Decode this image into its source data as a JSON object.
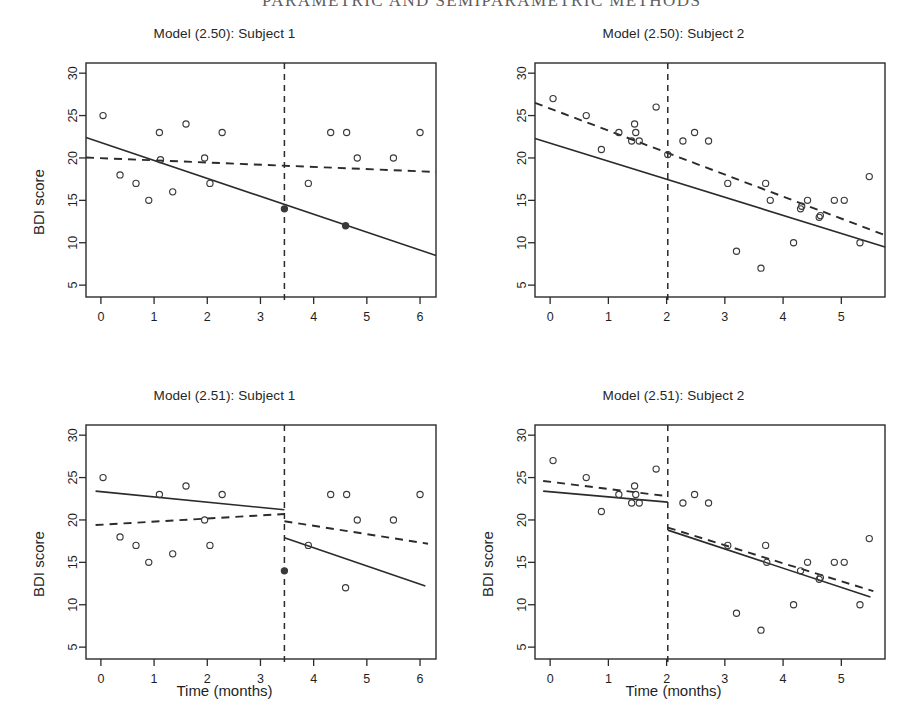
{
  "page": {
    "running_head": "PARAMETRIC AND SEMIPARAMETRIC METHODS",
    "folio": ""
  },
  "axis_titles": {
    "y": "BDI score",
    "x": "Time (months)"
  },
  "style": {
    "ink": "#1f1f1f",
    "line": "#2b2b2b",
    "point_stroke": "#3a3a3a",
    "background": "#ffffff"
  },
  "chart_data": [
    {
      "id": "panel-tl",
      "type": "scatter",
      "title": "Model (2.50): Subject 1",
      "xlabel": "",
      "ylabel": "BDI score",
      "xlim": [
        -0.28,
        6.3
      ],
      "ylim": [
        3.6,
        31.2
      ],
      "xticks": [
        0,
        1,
        2,
        3,
        4,
        5,
        6
      ],
      "yticks": [
        5,
        10,
        15,
        20,
        25,
        30
      ],
      "grid": false,
      "legend": "none",
      "points": [
        {
          "x": 0.04,
          "y": 25,
          "filled": false
        },
        {
          "x": 0.36,
          "y": 18,
          "filled": false
        },
        {
          "x": 0.66,
          "y": 17,
          "filled": false
        },
        {
          "x": 0.9,
          "y": 15,
          "filled": false
        },
        {
          "x": 1.1,
          "y": 23,
          "filled": false
        },
        {
          "x": 1.12,
          "y": 19.8,
          "filled": false
        },
        {
          "x": 1.35,
          "y": 16,
          "filled": false
        },
        {
          "x": 1.6,
          "y": 24,
          "filled": false
        },
        {
          "x": 1.95,
          "y": 20,
          "filled": false
        },
        {
          "x": 2.05,
          "y": 17,
          "filled": false
        },
        {
          "x": 2.28,
          "y": 23,
          "filled": false
        },
        {
          "x": 3.45,
          "y": 14,
          "filled": true
        },
        {
          "x": 3.9,
          "y": 17,
          "filled": false
        },
        {
          "x": 4.32,
          "y": 23,
          "filled": false
        },
        {
          "x": 4.6,
          "y": 12,
          "filled": true
        },
        {
          "x": 4.62,
          "y": 23,
          "filled": false
        },
        {
          "x": 4.82,
          "y": 20,
          "filled": false
        },
        {
          "x": 5.5,
          "y": 20,
          "filled": false
        },
        {
          "x": 6.0,
          "y": 23,
          "filled": false
        }
      ],
      "lines": [
        {
          "name": "subject-fit",
          "dash": "solid",
          "segments": [
            [
              {
                "x": -0.28,
                "y": 22.4
              },
              {
                "x": 6.3,
                "y": 8.5
              }
            ]
          ]
        },
        {
          "name": "population-fit",
          "dash": "dashed",
          "segments": [
            [
              {
                "x": -0.28,
                "y": 20.05
              },
              {
                "x": 6.3,
                "y": 18.35
              }
            ]
          ]
        }
      ],
      "vline": {
        "x": 3.45,
        "dash": "dashed"
      }
    },
    {
      "id": "panel-tr",
      "type": "scatter",
      "title": "Model (2.50): Subject 2",
      "xlabel": "",
      "ylabel": "BDI score",
      "xlim": [
        -0.26,
        5.75
      ],
      "ylim": [
        3.6,
        31.2
      ],
      "xticks": [
        0,
        1,
        2,
        3,
        4,
        5
      ],
      "yticks": [
        5,
        10,
        15,
        20,
        25,
        30
      ],
      "grid": false,
      "legend": "none",
      "points": [
        {
          "x": 0.05,
          "y": 27,
          "filled": false
        },
        {
          "x": 0.62,
          "y": 25,
          "filled": false
        },
        {
          "x": 0.88,
          "y": 21,
          "filled": false
        },
        {
          "x": 1.18,
          "y": 23,
          "filled": false
        },
        {
          "x": 1.4,
          "y": 22,
          "filled": false
        },
        {
          "x": 1.45,
          "y": 24,
          "filled": false
        },
        {
          "x": 1.47,
          "y": 23,
          "filled": false
        },
        {
          "x": 1.53,
          "y": 22,
          "filled": false
        },
        {
          "x": 1.82,
          "y": 26,
          "filled": false
        },
        {
          "x": 2.02,
          "y": 20.4,
          "filled": false
        },
        {
          "x": 2.28,
          "y": 22,
          "filled": false
        },
        {
          "x": 2.48,
          "y": 23,
          "filled": false
        },
        {
          "x": 2.72,
          "y": 22,
          "filled": false
        },
        {
          "x": 3.05,
          "y": 17,
          "filled": false
        },
        {
          "x": 3.2,
          "y": 9,
          "filled": false
        },
        {
          "x": 3.62,
          "y": 7,
          "filled": false
        },
        {
          "x": 3.7,
          "y": 17,
          "filled": false
        },
        {
          "x": 3.78,
          "y": 15,
          "filled": false
        },
        {
          "x": 4.18,
          "y": 10,
          "filled": false
        },
        {
          "x": 4.3,
          "y": 14,
          "filled": false
        },
        {
          "x": 4.32,
          "y": 14.3,
          "filled": false
        },
        {
          "x": 4.42,
          "y": 15,
          "filled": false
        },
        {
          "x": 4.62,
          "y": 13,
          "filled": false
        },
        {
          "x": 4.64,
          "y": 13.2,
          "filled": false
        },
        {
          "x": 4.88,
          "y": 15,
          "filled": false
        },
        {
          "x": 5.05,
          "y": 15,
          "filled": false
        },
        {
          "x": 5.32,
          "y": 10,
          "filled": false
        },
        {
          "x": 5.48,
          "y": 17.8,
          "filled": false
        }
      ],
      "lines": [
        {
          "name": "subject-fit",
          "dash": "solid",
          "segments": [
            [
              {
                "x": -0.26,
                "y": 22.3
              },
              {
                "x": 5.75,
                "y": 9.5
              }
            ]
          ]
        },
        {
          "name": "population-fit",
          "dash": "dashed",
          "segments": [
            [
              {
                "x": -0.26,
                "y": 26.5
              },
              {
                "x": 5.75,
                "y": 10.9
              }
            ]
          ]
        }
      ],
      "vline": {
        "x": 2.02,
        "dash": "dashed"
      }
    },
    {
      "id": "panel-bl",
      "type": "scatter",
      "title": "Model (2.51): Subject 1",
      "xlabel": "Time (months)",
      "ylabel": "BDI score",
      "xlim": [
        -0.28,
        6.3
      ],
      "ylim": [
        3.6,
        31.2
      ],
      "xticks": [
        0,
        1,
        2,
        3,
        4,
        5,
        6
      ],
      "yticks": [
        5,
        10,
        15,
        20,
        25,
        30
      ],
      "grid": false,
      "legend": "none",
      "points": [
        {
          "x": 0.04,
          "y": 25,
          "filled": false
        },
        {
          "x": 0.36,
          "y": 18,
          "filled": false
        },
        {
          "x": 0.66,
          "y": 17,
          "filled": false
        },
        {
          "x": 0.9,
          "y": 15,
          "filled": false
        },
        {
          "x": 1.1,
          "y": 23,
          "filled": false
        },
        {
          "x": 1.35,
          "y": 16,
          "filled": false
        },
        {
          "x": 1.6,
          "y": 24,
          "filled": false
        },
        {
          "x": 1.95,
          "y": 20,
          "filled": false
        },
        {
          "x": 2.05,
          "y": 17,
          "filled": false
        },
        {
          "x": 2.28,
          "y": 23,
          "filled": false
        },
        {
          "x": 3.45,
          "y": 14,
          "filled": true
        },
        {
          "x": 3.9,
          "y": 17,
          "filled": false
        },
        {
          "x": 4.32,
          "y": 23,
          "filled": false
        },
        {
          "x": 4.6,
          "y": 12,
          "filled": false
        },
        {
          "x": 4.62,
          "y": 23,
          "filled": false
        },
        {
          "x": 4.82,
          "y": 20,
          "filled": false
        },
        {
          "x": 5.5,
          "y": 20,
          "filled": false
        },
        {
          "x": 6.0,
          "y": 23,
          "filled": false
        }
      ],
      "lines": [
        {
          "name": "subject-fit",
          "dash": "solid",
          "segments": [
            [
              {
                "x": -0.1,
                "y": 23.4
              },
              {
                "x": 3.45,
                "y": 21.2
              }
            ],
            [
              {
                "x": 3.45,
                "y": 17.9
              },
              {
                "x": 6.1,
                "y": 12.2
              }
            ]
          ]
        },
        {
          "name": "population-fit",
          "dash": "dashed",
          "segments": [
            [
              {
                "x": -0.1,
                "y": 19.4
              },
              {
                "x": 3.45,
                "y": 20.7
              }
            ],
            [
              {
                "x": 3.45,
                "y": 19.85
              },
              {
                "x": 6.15,
                "y": 17.2
              }
            ]
          ]
        }
      ],
      "vline": {
        "x": 3.45,
        "dash": "dashed"
      }
    },
    {
      "id": "panel-br",
      "type": "scatter",
      "title": "Model (2.51): Subject 2",
      "xlabel": "Time (months)",
      "ylabel": "BDI score",
      "xlim": [
        -0.26,
        5.75
      ],
      "ylim": [
        3.6,
        31.2
      ],
      "xticks": [
        0,
        1,
        2,
        3,
        4,
        5
      ],
      "yticks": [
        5,
        10,
        15,
        20,
        25,
        30
      ],
      "grid": false,
      "legend": "none",
      "points": [
        {
          "x": 0.05,
          "y": 27,
          "filled": false
        },
        {
          "x": 0.62,
          "y": 25,
          "filled": false
        },
        {
          "x": 0.88,
          "y": 21,
          "filled": false
        },
        {
          "x": 1.18,
          "y": 23,
          "filled": false
        },
        {
          "x": 1.4,
          "y": 22,
          "filled": false
        },
        {
          "x": 1.45,
          "y": 24,
          "filled": false
        },
        {
          "x": 1.47,
          "y": 23,
          "filled": false
        },
        {
          "x": 1.53,
          "y": 22,
          "filled": false
        },
        {
          "x": 1.82,
          "y": 26,
          "filled": false
        },
        {
          "x": 2.28,
          "y": 22,
          "filled": false
        },
        {
          "x": 2.48,
          "y": 23,
          "filled": false
        },
        {
          "x": 2.72,
          "y": 22,
          "filled": false
        },
        {
          "x": 3.05,
          "y": 17,
          "filled": false
        },
        {
          "x": 3.2,
          "y": 9,
          "filled": false
        },
        {
          "x": 3.62,
          "y": 7,
          "filled": false
        },
        {
          "x": 3.7,
          "y": 17,
          "filled": false
        },
        {
          "x": 3.72,
          "y": 15,
          "filled": false
        },
        {
          "x": 4.18,
          "y": 10,
          "filled": false
        },
        {
          "x": 4.3,
          "y": 14,
          "filled": false
        },
        {
          "x": 4.42,
          "y": 15,
          "filled": false
        },
        {
          "x": 4.62,
          "y": 13,
          "filled": false
        },
        {
          "x": 4.64,
          "y": 13.2,
          "filled": false
        },
        {
          "x": 4.88,
          "y": 15,
          "filled": false
        },
        {
          "x": 5.05,
          "y": 15,
          "filled": false
        },
        {
          "x": 5.32,
          "y": 10,
          "filled": false
        },
        {
          "x": 5.48,
          "y": 17.8,
          "filled": false
        }
      ],
      "lines": [
        {
          "name": "subject-fit",
          "dash": "solid",
          "segments": [
            [
              {
                "x": -0.12,
                "y": 23.4
              },
              {
                "x": 2.02,
                "y": 22.1
              }
            ],
            [
              {
                "x": 2.02,
                "y": 18.8
              },
              {
                "x": 5.5,
                "y": 10.9
              }
            ]
          ]
        },
        {
          "name": "population-fit",
          "dash": "dashed",
          "segments": [
            [
              {
                "x": -0.12,
                "y": 24.6
              },
              {
                "x": 2.02,
                "y": 22.8
              }
            ],
            [
              {
                "x": 2.02,
                "y": 19.1
              },
              {
                "x": 5.55,
                "y": 11.6
              }
            ]
          ]
        }
      ],
      "vline": {
        "x": 2.02,
        "dash": "dashed"
      }
    }
  ]
}
